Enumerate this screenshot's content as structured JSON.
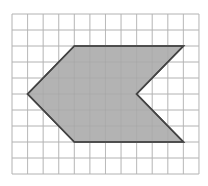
{
  "diagram": {
    "type": "shape-on-grid",
    "grid": {
      "columns": 12,
      "rows": 10,
      "origin_px": [
        12,
        14
      ],
      "cell_w_px": 15.58,
      "cell_h_px": 16.0,
      "line_color": "#c6c6c6"
    },
    "shape": {
      "name": "arrow-pointing-left hexagon",
      "fill_color": "#b3b3b3",
      "stroke_color": "#444444",
      "vertices_grid": [
        [
          4,
          2
        ],
        [
          11,
          2
        ],
        [
          8,
          5
        ],
        [
          11,
          8
        ],
        [
          4,
          8
        ],
        [
          1,
          5
        ]
      ]
    }
  }
}
